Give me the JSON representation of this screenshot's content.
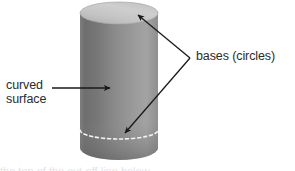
{
  "figure": {
    "shape": "cylinder",
    "background_color": "#ffffff"
  },
  "labels": {
    "curved_surface_line1": "curved",
    "curved_surface_line2": "surface",
    "bases": "bases (circles)"
  },
  "bleed": {
    "text": "the top of the cut-off line below"
  },
  "colors": {
    "text": "#2b2b2b",
    "arrow": "#1a1a1a",
    "top_face_light": "#cfcfcf",
    "top_face_dark": "#b4b4b4",
    "body_dark": "#6f6f6f",
    "body_mid": "#8e8e8e",
    "body_light": "#a2a2a2",
    "hidden_edge": "#ffffff"
  },
  "geometry": {
    "cylinder_left_x": 80,
    "cylinder_right_x": 158,
    "top_ellipse_center_y": 13,
    "top_ellipse_ry": 11,
    "bottom_center_y": 148,
    "bottom_ellipse_ry": 12,
    "hidden_base_center_y": 130,
    "hidden_base_ry": 9
  },
  "arrows": {
    "curved_surface": {
      "from_x": 52,
      "from_y": 88,
      "to_x": 112,
      "to_y": 88
    },
    "base_top": {
      "from_x": 190,
      "from_y": 58,
      "to_x": 136,
      "to_y": 14
    },
    "base_bottom": {
      "from_x": 190,
      "from_y": 58,
      "to_x": 123,
      "to_y": 134
    }
  }
}
